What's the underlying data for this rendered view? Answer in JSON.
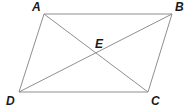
{
  "figure": {
    "name": "parallelogram-with-diagonals",
    "type": "geometry-diagram",
    "width": 191,
    "height": 110,
    "background_color": "#ffffff",
    "stroke_color": "#8f8f8f",
    "stroke_width": 1,
    "label_color": "#1a1a1a"
  },
  "points": {
    "A": {
      "label": "A",
      "x": 44,
      "y": 14,
      "label_x": 32,
      "label_y": 1
    },
    "B": {
      "label": "B",
      "x": 172,
      "y": 14,
      "label_x": 175,
      "label_y": 1
    },
    "C": {
      "label": "C",
      "x": 148,
      "y": 92,
      "label_x": 151,
      "label_y": 95
    },
    "D": {
      "label": "D",
      "x": 19,
      "y": 92,
      "label_x": 6,
      "label_y": 95
    },
    "E": {
      "label": "E",
      "x": 99,
      "y": 54,
      "label_x": 95,
      "label_y": 38
    }
  },
  "segments": [
    {
      "name": "side-AB",
      "from": "A",
      "to": "B"
    },
    {
      "name": "side-BC",
      "from": "B",
      "to": "C"
    },
    {
      "name": "side-CD",
      "from": "C",
      "to": "D"
    },
    {
      "name": "side-DA",
      "from": "D",
      "to": "A"
    },
    {
      "name": "diagonal-AC",
      "from": "A",
      "to": "C"
    },
    {
      "name": "diagonal-BD",
      "from": "B",
      "to": "D"
    }
  ]
}
